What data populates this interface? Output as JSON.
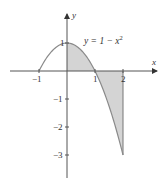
{
  "chart_data": {
    "type": "area",
    "title": "",
    "equation_label": "y = 1 − x",
    "equation_exponent": "2",
    "function": "y = 1 - x^2",
    "xlabel": "x",
    "ylabel": "y",
    "xlim": [
      -1.3,
      2.6
    ],
    "ylim": [
      -3.8,
      2.2
    ],
    "x_ticks": [
      {
        "value": -1,
        "label": "−1"
      },
      {
        "value": 1,
        "label": "1"
      },
      {
        "value": 2,
        "label": "2"
      }
    ],
    "y_ticks": [
      {
        "value": 1,
        "label": "1"
      },
      {
        "value": -1,
        "label": "−1"
      },
      {
        "value": -2,
        "label": "−2"
      },
      {
        "value": -3,
        "label": "−3"
      }
    ],
    "curve_domain": [
      -1,
      2
    ],
    "shaded_region": {
      "from": 0,
      "to": 2,
      "between": "curve and x-axis"
    },
    "points": [
      {
        "x": -1,
        "y": 0
      },
      {
        "x": 0,
        "y": 1
      },
      {
        "x": 1,
        "y": 0
      },
      {
        "x": 2,
        "y": -3
      }
    ],
    "grid": false,
    "colors": {
      "axis": "#555555",
      "curve": "#8a8a8a",
      "fill": "#d4d4d4"
    }
  }
}
